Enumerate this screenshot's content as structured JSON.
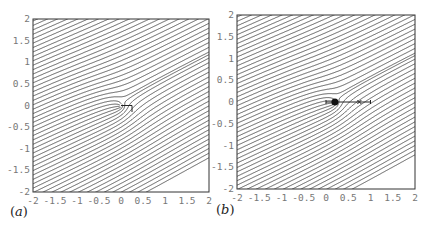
{
  "chart_data": [
    {
      "type": "streamline",
      "panel_label": "(a)",
      "title": "",
      "xlabel": "",
      "ylabel": "",
      "xlim": [
        -2,
        2
      ],
      "ylim": [
        -2,
        2
      ],
      "xticks": [
        "-2",
        "-1.5",
        "-1",
        "-0.5",
        "0",
        "0.5",
        "1",
        "1.5",
        "2"
      ],
      "yticks": [
        "2",
        "1.5",
        "1",
        "0.5",
        "0",
        "-0.5",
        "-1",
        "-1.5",
        "-2"
      ],
      "grid": false,
      "description": "Streamlines of a uniform oblique flow (slope ~0.5) deflected around a singular point at the origin, with a horizontal cut/slit from x=0 to x~0.25 along y=0",
      "background_flow_slope": 0.5,
      "singularity": {
        "x": 0,
        "y": 0
      },
      "slit": {
        "x0": 0,
        "x1": 0.25,
        "y": 0
      },
      "line_color": "#333333",
      "n_streamlines": 60
    },
    {
      "type": "streamline",
      "panel_label": "(b)",
      "title": "",
      "xlabel": "",
      "ylabel": "",
      "xlim": [
        -2,
        2
      ],
      "ylim": [
        -2,
        2
      ],
      "xticks": [
        "-2",
        "-1.5",
        "-1",
        "-0.5",
        "0",
        "0.5",
        "1",
        "1.5",
        "2"
      ],
      "yticks": [
        "2",
        "1.5",
        "1",
        "0.5",
        "0",
        "-0.5",
        "-1",
        "-1.5",
        "-2"
      ],
      "grid": false,
      "description": "Streamlines of a uniform oblique flow (slope ~0.5) with a point vortex/source marked by a black dot near (0.2, 0) and a segment along y=0 from x=0 to x=1 with tick marks and a cross marker near x=0.75",
      "background_flow_slope": 0.5,
      "singularity": {
        "x": 0.2,
        "y": 0
      },
      "segment": {
        "x0": 0,
        "x1": 1,
        "y": 0
      },
      "markers": [
        {
          "type": "dot",
          "x": 0.2,
          "y": 0
        },
        {
          "type": "cross",
          "x": 0.75,
          "y": 0
        },
        {
          "type": "tick",
          "x": 0,
          "y": 0
        },
        {
          "type": "tick",
          "x": 1,
          "y": 0
        }
      ],
      "line_color": "#333333",
      "n_streamlines": 60
    }
  ],
  "panels": [
    {
      "label_letter": "a",
      "frame": {
        "x": 33,
        "y": 19,
        "w": 176,
        "h": 173
      }
    },
    {
      "label_letter": "b",
      "frame": {
        "x": 237,
        "y": 15,
        "w": 178,
        "h": 174
      }
    }
  ]
}
